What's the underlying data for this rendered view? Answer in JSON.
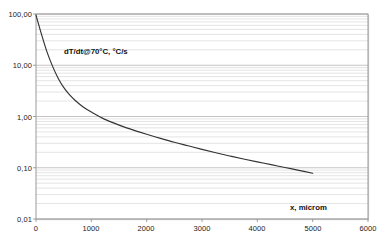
{
  "chart_data": {
    "type": "line",
    "title": "",
    "subtitle": "",
    "xlabel": "x, microm",
    "ylabel": "",
    "series_annotation": "dT/dt@70°C, °C/s",
    "legend_position": "inside-plot-upper-left",
    "grid": true,
    "grid_style": "horizontal log minor gridlines",
    "yscale": "log",
    "xscale": "linear",
    "xlim": [
      0,
      6000
    ],
    "ylim": [
      0.01,
      100
    ],
    "xticks": [
      0,
      1000,
      2000,
      3000,
      4000,
      5000,
      6000
    ],
    "xtick_labels": [
      "0",
      "1000",
      "2000",
      "3000",
      "4000",
      "5000",
      "6000"
    ],
    "yticks": [
      0.01,
      0.1,
      1,
      10,
      100
    ],
    "ytick_labels": [
      "0,01",
      "0,10",
      "1,00",
      "10,00",
      "100,00"
    ],
    "decimal_separator": ",",
    "series": [
      {
        "name": "dT/dt@70°C, °C/s",
        "color": "#333333",
        "x": [
          0,
          100,
          200,
          300,
          400,
          500,
          600,
          700,
          800,
          900,
          1000,
          1200,
          1400,
          1600,
          1800,
          2000,
          2250,
          2500,
          2750,
          3000,
          3250,
          3500,
          3750,
          4000,
          4250,
          4500,
          4750,
          5000
        ],
        "values": [
          95.0,
          40.0,
          18.0,
          9.5,
          5.6,
          3.7,
          2.7,
          2.1,
          1.7,
          1.42,
          1.22,
          0.93,
          0.75,
          0.62,
          0.525,
          0.45,
          0.375,
          0.315,
          0.268,
          0.228,
          0.196,
          0.17,
          0.148,
          0.13,
          0.115,
          0.101,
          0.089,
          0.078
        ]
      }
    ],
    "colors": {
      "plot_border": "#808080",
      "gridline": "#c8c8c8",
      "curve": "#333333",
      "background": "#ffffff",
      "text": "#111111"
    }
  },
  "axis": {
    "x_title": "x, microm",
    "y_labels": [
      "100,00",
      "10,00",
      "1,00",
      "0,10",
      "0,01"
    ],
    "x_labels": [
      "0",
      "1000",
      "2000",
      "3000",
      "4000",
      "5000",
      "6000"
    ]
  },
  "annotations": {
    "series_label": "dT/dt@70°C, °C/s"
  }
}
